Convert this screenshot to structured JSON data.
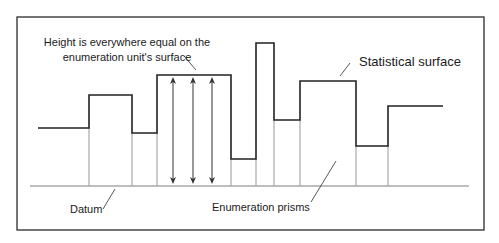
{
  "diagram": {
    "type": "prism-map-profile",
    "colors": {
      "frame": "#3a3a3a",
      "surface": "#222222",
      "prism_walls": "#a8a8a8",
      "datum": "#a8a8a8",
      "arrows": "#333333",
      "leader": "#444444",
      "text": "#1a1a1a"
    },
    "frame": {
      "x": 17,
      "y": 17,
      "width": 467,
      "height": 213
    },
    "datum": {
      "y": 186,
      "x1": 30,
      "x2": 469
    },
    "steps": [
      {
        "x1": 38,
        "x2": 89,
        "y": 128
      },
      {
        "x1": 89,
        "x2": 132,
        "y": 95
      },
      {
        "x1": 132,
        "x2": 157,
        "y": 133
      },
      {
        "x1": 157,
        "x2": 231,
        "y": 75
      },
      {
        "x1": 231,
        "x2": 256,
        "y": 159
      },
      {
        "x1": 256,
        "x2": 274,
        "y": 43
      },
      {
        "x1": 274,
        "x2": 300,
        "y": 120
      },
      {
        "x1": 300,
        "x2": 356,
        "y": 81
      },
      {
        "x1": 356,
        "x2": 388,
        "y": 146
      },
      {
        "x1": 388,
        "x2": 443,
        "y": 106
      }
    ],
    "height_arrows": {
      "xs": [
        173,
        193,
        212
      ],
      "top": 77,
      "bottom": 184
    },
    "labels": {
      "height_note_line1": "Height is everywhere equal on the",
      "height_note_line2": "enumeration unit's surface",
      "statistical_surface": "Statistical surface",
      "datum": "Datum",
      "enumeration_prisms": "Enumeration prisms"
    },
    "label_positions": {
      "height_note_line1": {
        "x": 127,
        "y": 46
      },
      "height_note_line2": {
        "x": 127,
        "y": 61
      },
      "statistical_surface": {
        "x": 359,
        "y": 66
      },
      "datum": {
        "x": 70,
        "y": 213
      },
      "enumeration_prisms": {
        "x": 212,
        "y": 211
      }
    },
    "leaders": {
      "height_note": {
        "x1": 184,
        "y1": 56,
        "x2": 196,
        "y2": 70
      },
      "statistical_surface": {
        "x1": 350,
        "y1": 63,
        "x2": 340,
        "y2": 76
      },
      "datum": {
        "x1": 103,
        "y1": 209,
        "x2": 115,
        "y2": 189
      },
      "enumeration_prisms": {
        "x1": 311,
        "y1": 202,
        "x2": 336,
        "y2": 161
      }
    }
  }
}
